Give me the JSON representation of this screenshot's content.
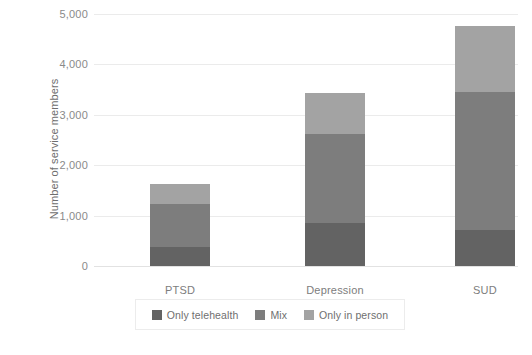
{
  "chart_data": {
    "type": "bar",
    "subtype": "stacked-vertical",
    "title": "",
    "subtitle": "",
    "xlabel": "",
    "ylabel": "Number of service members",
    "categories": [
      "PTSD",
      "Depression",
      "SUD"
    ],
    "series": [
      {
        "name": "Only telehealth",
        "color": "#636363",
        "values": [
          370,
          860,
          720
        ]
      },
      {
        "name": "Mix",
        "color": "#7d7d7d",
        "values": [
          860,
          1750,
          2730
        ]
      },
      {
        "name": "Only in person",
        "color": "#a3a3a3",
        "values": [
          390,
          820,
          1310
        ]
      }
    ],
    "totals": [
      1620,
      3430,
      4760
    ],
    "ylim": [
      0,
      5000
    ],
    "yticks": [
      0,
      1000,
      2000,
      3000,
      4000,
      5000
    ],
    "ytick_labels": [
      "0",
      "1,000",
      "2,000",
      "3,000",
      "4,000",
      "5,000"
    ],
    "grid": true,
    "grid_axis": "y",
    "legend_position": "bottom",
    "legend_entries": [
      "Only telehealth",
      "Mix",
      "Only in person"
    ],
    "background_color": "#ffffff",
    "gridline_color": "#ebebeb",
    "tick_label_color": "#8a8a8a",
    "axis_label_color": "#6e6e6e"
  }
}
